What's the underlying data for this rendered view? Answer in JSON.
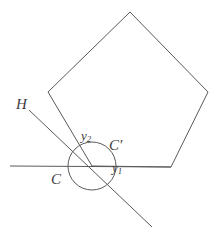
{
  "figure": {
    "kind": "geometry-diagram",
    "canvas": {
      "width": 218,
      "height": 238
    },
    "background_color": "#ffffff",
    "stroke_color": "#5a5a5a",
    "label_color": "#3d3d3d",
    "labels": {
      "H": "H",
      "C": "C",
      "C_prime_base": "C",
      "C_prime_mark": "′",
      "y_base": "y",
      "y1_sub": "1",
      "y2_sub": "2"
    },
    "shapes": {
      "pentagon": {
        "name": "pentagon",
        "points": "130,12 208,92 171,167 92,166 48,92"
      },
      "circle": {
        "name": "circle-C",
        "cx": 92,
        "cy": 166,
        "r": 24
      },
      "horizontal_line": {
        "name": "line-C",
        "x1": 10,
        "y1": 166,
        "x2": 171,
        "y2": 167
      },
      "transversal_line": {
        "name": "line-H",
        "x1": 29,
        "y1": 110,
        "x2": 152,
        "y2": 227
      }
    }
  }
}
